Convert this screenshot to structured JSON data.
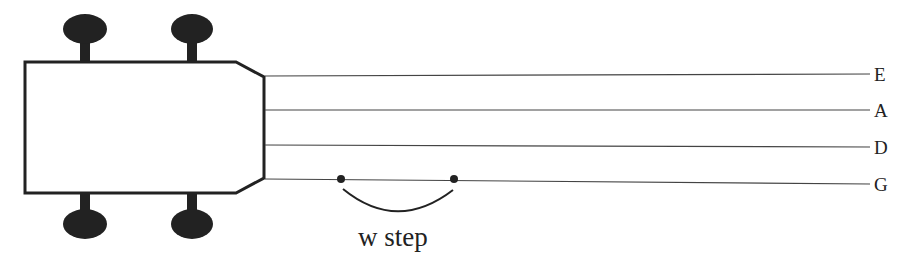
{
  "diagram": {
    "strings": [
      {
        "name": "E",
        "y_left": 76,
        "y_right": 74
      },
      {
        "name": "A",
        "y_left": 110,
        "y_right": 110
      },
      {
        "name": "D",
        "y_left": 145,
        "y_right": 147
      },
      {
        "name": "G",
        "y_left": 179,
        "y_right": 184
      }
    ],
    "annotation": {
      "label": "w step",
      "from_x": 341,
      "to_x": 454
    },
    "colors": {
      "ink": "#222222",
      "line": "#444444",
      "background": "#ffffff"
    }
  }
}
